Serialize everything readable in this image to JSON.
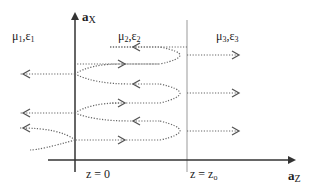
{
  "diagram": {
    "type": "wave-reflection-two-interfaces",
    "axes": {
      "vertical_label_main": "a",
      "vertical_label_sub": "X",
      "horizontal_label_main": "a",
      "horizontal_label_sub": "Z"
    },
    "regions": [
      {
        "mu": "μ",
        "mu_sub": "1",
        "eps": "ε",
        "eps_sub": "1"
      },
      {
        "mu": "μ",
        "mu_sub": "2",
        "eps": "ε",
        "eps_sub": "2"
      },
      {
        "mu": "μ",
        "mu_sub": "3",
        "eps": "ε",
        "eps_sub": "3"
      }
    ],
    "interfaces": [
      {
        "label": "z = 0"
      },
      {
        "label_main": "z = z",
        "label_sub": "o"
      }
    ],
    "colors": {
      "axis": "#333333",
      "interface_line": "#888888",
      "wave_path": "#666666",
      "arrowhead": "#555555"
    }
  }
}
